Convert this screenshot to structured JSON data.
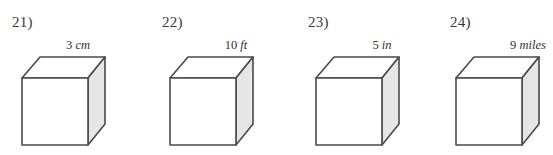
{
  "worksheet": {
    "background_color": "#ffffff",
    "stroke_color": "#4a4a4a",
    "front_face_color": "#ffffff",
    "top_face_color": "#ffffff",
    "right_face_color": "#e6e6e6",
    "text_color": "#3a3a3a"
  },
  "problems": [
    {
      "number": "21)",
      "value": "3",
      "unit": "cm",
      "shape": "cube",
      "label": "3 cm"
    },
    {
      "number": "22)",
      "value": "10",
      "unit": "ft",
      "shape": "cube",
      "label": "10 ft"
    },
    {
      "number": "23)",
      "value": "5",
      "unit": "in",
      "shape": "cube",
      "label": "5 in"
    },
    {
      "number": "24)",
      "value": "9",
      "unit": "miles",
      "shape": "cube",
      "label": "9 miles"
    }
  ]
}
